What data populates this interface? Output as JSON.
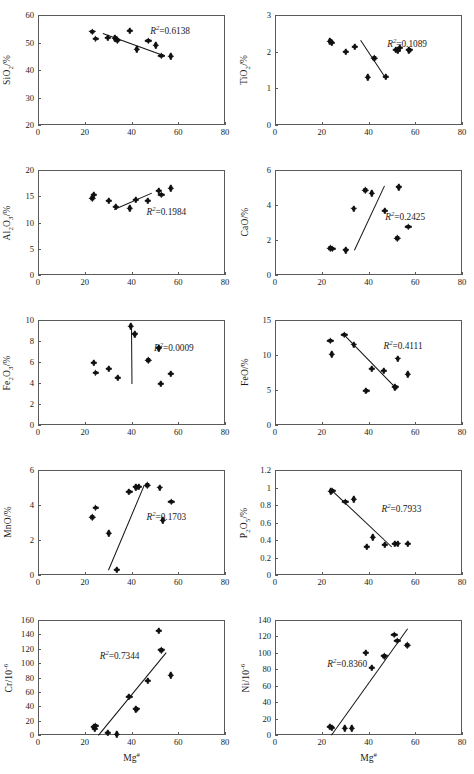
{
  "figure": {
    "xlabel": "Mg#",
    "x_axis": {
      "min": 0,
      "max": 80,
      "ticks": [
        0,
        20,
        40,
        60,
        80
      ]
    }
  },
  "chart_data": [
    {
      "type": "scatter",
      "panel": "sio2",
      "title": "",
      "ylabel_html": "SiO<sub>2</sub>/%",
      "ylabel": "SiO2/%",
      "xlabel": "Mg#",
      "xlim": [
        0,
        80
      ],
      "ylim": [
        20,
        60
      ],
      "xticks": [
        0,
        20,
        40,
        60,
        80
      ],
      "yticks": [
        20,
        30,
        40,
        50,
        60
      ],
      "r2_label": "R2=0.6138",
      "r2_value": 0.6138,
      "points": [
        {
          "x": 23.2,
          "y": 54.0
        },
        {
          "x": 24.6,
          "y": 51.3
        },
        {
          "x": 29.8,
          "y": 51.6
        },
        {
          "x": 33.0,
          "y": 51.5
        },
        {
          "x": 34.0,
          "y": 50.8
        },
        {
          "x": 39.3,
          "y": 54.2
        },
        {
          "x": 42.2,
          "y": 47.5
        },
        {
          "x": 47.2,
          "y": 50.6
        },
        {
          "x": 50.5,
          "y": 49.0
        },
        {
          "x": 52.8,
          "y": 45.1
        },
        {
          "x": 56.8,
          "y": 45.0
        }
      ],
      "fit": {
        "x1": 28.0,
        "y1": 53.4,
        "x2": 54.5,
        "y2": 45.2,
        "slope": -0.31
      }
    },
    {
      "type": "scatter",
      "panel": "tio2",
      "ylabel_html": "TiO<sub>2</sub>/%",
      "ylabel": "TiO2/%",
      "xlabel": "Mg#",
      "xlim": [
        0,
        80
      ],
      "ylim": [
        0,
        3
      ],
      "xticks": [
        0,
        20,
        40,
        60,
        80
      ],
      "yticks": [
        0,
        1,
        2,
        3
      ],
      "r2_label": "R2=0.1089",
      "r2_value": 0.1089,
      "points": [
        {
          "x": 23.6,
          "y": 2.28
        },
        {
          "x": 24.3,
          "y": 2.24
        },
        {
          "x": 30.3,
          "y": 1.99
        },
        {
          "x": 34.2,
          "y": 2.13
        },
        {
          "x": 39.6,
          "y": 1.3
        },
        {
          "x": 42.5,
          "y": 1.82
        },
        {
          "x": 47.4,
          "y": 1.32
        },
        {
          "x": 51.6,
          "y": 2.05
        },
        {
          "x": 52.6,
          "y": 2.03
        },
        {
          "x": 53.3,
          "y": 2.1
        },
        {
          "x": 57.4,
          "y": 2.04
        }
      ],
      "fit": {
        "x1": 37.0,
        "y1": 2.31,
        "x2": 47.6,
        "y2": 1.29,
        "slope": -0.096
      }
    },
    {
      "type": "scatter",
      "panel": "al2o3",
      "ylabel_html": "Al<sub>2</sub>O<sub>3</sub>/%",
      "ylabel": "Al2O3/%",
      "xlabel": "Mg#",
      "xlim": [
        0,
        80
      ],
      "ylim": [
        0,
        20
      ],
      "xticks": [
        0,
        20,
        40,
        60,
        80
      ],
      "yticks": [
        0,
        5,
        10,
        15,
        20
      ],
      "r2_label": "R2=0.1984",
      "r2_value": 0.1984,
      "points": [
        {
          "x": 23.2,
          "y": 14.6
        },
        {
          "x": 24.0,
          "y": 15.3
        },
        {
          "x": 30.2,
          "y": 14.1
        },
        {
          "x": 33.3,
          "y": 13.0
        },
        {
          "x": 39.3,
          "y": 12.7
        },
        {
          "x": 41.9,
          "y": 14.3
        },
        {
          "x": 46.9,
          "y": 14.1
        },
        {
          "x": 51.6,
          "y": 16.0
        },
        {
          "x": 52.8,
          "y": 15.3
        },
        {
          "x": 56.8,
          "y": 16.5
        }
      ],
      "fit": {
        "x1": 32.5,
        "y1": 12.6,
        "x2": 48.5,
        "y2": 15.7,
        "slope": 0.19
      }
    },
    {
      "type": "scatter",
      "panel": "cao",
      "ylabel_html": "CaO/%",
      "ylabel": "CaO/%",
      "xlabel": "Mg#",
      "xlim": [
        0,
        80
      ],
      "ylim": [
        0,
        6
      ],
      "xticks": [
        0,
        20,
        40,
        60,
        80
      ],
      "yticks": [
        0,
        2,
        4,
        6
      ],
      "r2_label": "R2=0.2425",
      "r2_value": 0.2425,
      "points": [
        {
          "x": 23.7,
          "y": 1.52
        },
        {
          "x": 24.5,
          "y": 1.5
        },
        {
          "x": 30.2,
          "y": 1.42
        },
        {
          "x": 33.7,
          "y": 3.8
        },
        {
          "x": 38.7,
          "y": 4.83
        },
        {
          "x": 41.4,
          "y": 4.67
        },
        {
          "x": 47.1,
          "y": 3.68
        },
        {
          "x": 52.3,
          "y": 2.1
        },
        {
          "x": 53.0,
          "y": 5.02
        },
        {
          "x": 57.0,
          "y": 2.76
        }
      ],
      "fit": {
        "x1": 33.8,
        "y1": 1.42,
        "x2": 46.6,
        "y2": 5.08,
        "slope": 0.286
      }
    },
    {
      "type": "scatter",
      "panel": "fe2o3",
      "ylabel_html": "Fe<sub>2</sub>O<sub>3</sub>/%",
      "ylabel": "Fe2O3/%",
      "xlabel": "Mg#",
      "xlim": [
        0,
        80
      ],
      "ylim": [
        0,
        10
      ],
      "xticks": [
        0,
        20,
        40,
        60,
        80
      ],
      "yticks": [
        0,
        2,
        4,
        6,
        8,
        10
      ],
      "r2_label": "R2=0.0009",
      "r2_value": 0.0009,
      "points": [
        {
          "x": 23.8,
          "y": 5.9
        },
        {
          "x": 24.6,
          "y": 4.95
        },
        {
          "x": 30.2,
          "y": 5.35
        },
        {
          "x": 34.1,
          "y": 4.5
        },
        {
          "x": 39.7,
          "y": 9.4
        },
        {
          "x": 41.3,
          "y": 8.65
        },
        {
          "x": 47.2,
          "y": 6.15
        },
        {
          "x": 51.6,
          "y": 7.32
        },
        {
          "x": 52.6,
          "y": 3.95
        },
        {
          "x": 56.8,
          "y": 4.9
        }
      ],
      "fit": {
        "x1": 40.1,
        "y1": 9.45,
        "x2": 40.3,
        "y2": 3.95,
        "slope": -27.5
      }
    },
    {
      "type": "scatter",
      "panel": "feo",
      "ylabel_html": "FeO/%",
      "ylabel": "FeO/%",
      "xlabel": "Mg#",
      "xlim": [
        0,
        80
      ],
      "ylim": [
        0,
        15
      ],
      "xticks": [
        0,
        20,
        40,
        60,
        80
      ],
      "yticks": [
        0,
        5,
        10,
        15
      ],
      "r2_label": "R2=0.4111",
      "r2_value": 0.4111,
      "points": [
        {
          "x": 23.7,
          "y": 12.0
        },
        {
          "x": 24.2,
          "y": 10.1
        },
        {
          "x": 29.7,
          "y": 12.9
        },
        {
          "x": 33.6,
          "y": 11.5
        },
        {
          "x": 39.0,
          "y": 4.85
        },
        {
          "x": 41.3,
          "y": 8.0
        },
        {
          "x": 46.5,
          "y": 7.75
        },
        {
          "x": 51.4,
          "y": 5.4
        },
        {
          "x": 52.6,
          "y": 9.5
        },
        {
          "x": 56.8,
          "y": 7.25
        }
      ],
      "fit": {
        "x1": 29.6,
        "y1": 12.95,
        "x2": 51.6,
        "y2": 5.4,
        "slope": -0.343
      }
    },
    {
      "type": "scatter",
      "panel": "mno",
      "ylabel_html": "MnO/%",
      "ylabel": "MnO/%",
      "xlabel": "Mg#",
      "xlim": [
        0,
        80
      ],
      "ylim": [
        0,
        6
      ],
      "xticks": [
        0,
        20,
        40,
        60,
        80
      ],
      "yticks": [
        0,
        2,
        4,
        6
      ],
      "r2_label": "R2=0.1703",
      "r2_value": 0.1703,
      "points": [
        {
          "x": 23.3,
          "y": 3.3
        },
        {
          "x": 24.6,
          "y": 3.85
        },
        {
          "x": 30.2,
          "y": 2.38
        },
        {
          "x": 33.7,
          "y": 0.28
        },
        {
          "x": 39.0,
          "y": 4.75
        },
        {
          "x": 42.0,
          "y": 5.02
        },
        {
          "x": 43.1,
          "y": 5.05
        },
        {
          "x": 46.8,
          "y": 5.12
        },
        {
          "x": 52.0,
          "y": 5.0
        },
        {
          "x": 53.3,
          "y": 3.12
        },
        {
          "x": 57.0,
          "y": 4.18
        }
      ],
      "fit": {
        "x1": 30.0,
        "y1": 0.3,
        "x2": 45.3,
        "y2": 5.15,
        "slope": 0.317
      }
    },
    {
      "type": "scatter",
      "panel": "p2o5",
      "ylabel_html": "P<sub>2</sub>O<sub>5</sub>/%",
      "ylabel": "P2O5/%",
      "xlabel": "Mg#",
      "xlim": [
        0,
        80
      ],
      "ylim": [
        0,
        1.2
      ],
      "xticks": [
        0,
        20,
        40,
        60,
        80
      ],
      "yticks": [
        0,
        0.2,
        0.4,
        0.6,
        0.8,
        1.0,
        1.2
      ],
      "ytick_labels": [
        "0",
        "0.2",
        "0.4",
        "0.6",
        "0.8",
        "1",
        "1.2"
      ],
      "r2_label": "R2=0.7933",
      "r2_value": 0.7933,
      "points": [
        {
          "x": 23.8,
          "y": 0.955
        },
        {
          "x": 24.6,
          "y": 0.96
        },
        {
          "x": 30.1,
          "y": 0.835
        },
        {
          "x": 33.8,
          "y": 0.865
        },
        {
          "x": 39.4,
          "y": 0.32
        },
        {
          "x": 41.9,
          "y": 0.43
        },
        {
          "x": 47.0,
          "y": 0.345
        },
        {
          "x": 51.4,
          "y": 0.355
        },
        {
          "x": 52.5,
          "y": 0.36
        },
        {
          "x": 56.8,
          "y": 0.355
        }
      ],
      "fit": {
        "x1": 24.0,
        "y1": 0.985,
        "x2": 50.0,
        "y2": 0.33,
        "slope": -0.0252
      }
    },
    {
      "type": "scatter",
      "panel": "cr",
      "ylabel_html": "Cr/10<sup>-6</sup>",
      "ylabel": "Cr/10-6",
      "xlabel": "Mg#",
      "xlim": [
        0,
        80
      ],
      "ylim": [
        0,
        160
      ],
      "xticks": [
        0,
        20,
        40,
        60,
        80
      ],
      "yticks": [
        0,
        20,
        40,
        60,
        80,
        100,
        120,
        140,
        160
      ],
      "r2_label": "R2=0.7344",
      "r2_value": 0.7344,
      "points": [
        {
          "x": 23.8,
          "y": 11
        },
        {
          "x": 24.3,
          "y": 9
        },
        {
          "x": 24.6,
          "y": 13
        },
        {
          "x": 29.8,
          "y": 3
        },
        {
          "x": 33.6,
          "y": 1
        },
        {
          "x": 39.0,
          "y": 53
        },
        {
          "x": 42.0,
          "y": 36
        },
        {
          "x": 46.9,
          "y": 75
        },
        {
          "x": 51.6,
          "y": 145
        },
        {
          "x": 52.8,
          "y": 118
        },
        {
          "x": 56.8,
          "y": 83
        }
      ],
      "fit": {
        "x1": 25.5,
        "y1": 0,
        "x2": 54.5,
        "y2": 115,
        "slope": 3.97
      }
    },
    {
      "type": "scatter",
      "panel": "ni",
      "ylabel_html": "Ni/10<sup>-6</sup>",
      "ylabel": "Ni/10-6",
      "xlabel": "Mg#",
      "xlim": [
        0,
        80
      ],
      "ylim": [
        0,
        140
      ],
      "xticks": [
        0,
        20,
        40,
        60,
        80
      ],
      "yticks": [
        0,
        20,
        40,
        60,
        80,
        100,
        120,
        140
      ],
      "r2_label": "R2=0.8360",
      "r2_value": 0.836,
      "points": [
        {
          "x": 23.6,
          "y": 10
        },
        {
          "x": 24.4,
          "y": 9
        },
        {
          "x": 29.8,
          "y": 8
        },
        {
          "x": 32.8,
          "y": 8
        },
        {
          "x": 38.8,
          "y": 100
        },
        {
          "x": 41.4,
          "y": 82
        },
        {
          "x": 46.8,
          "y": 96
        },
        {
          "x": 51.0,
          "y": 122
        },
        {
          "x": 52.3,
          "y": 115
        },
        {
          "x": 56.6,
          "y": 109
        }
      ],
      "fit": {
        "x1": 23.8,
        "y1": 0,
        "x2": 56.5,
        "y2": 130,
        "slope": 3.98
      }
    }
  ]
}
